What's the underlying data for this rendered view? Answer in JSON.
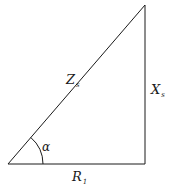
{
  "diagram": {
    "type": "right-triangle",
    "stroke_color": "#1a1a1a",
    "vertices": {
      "bottom_left": [
        8,
        164
      ],
      "bottom_right": [
        145,
        164
      ],
      "top_right": [
        145,
        5
      ]
    },
    "labels": {
      "hypotenuse": {
        "main": "Z",
        "sub": "s"
      },
      "vertical_side": {
        "main": "X",
        "sub": "s"
      },
      "base": {
        "main": "R",
        "sub": "1"
      },
      "angle": {
        "main": "α"
      }
    }
  }
}
